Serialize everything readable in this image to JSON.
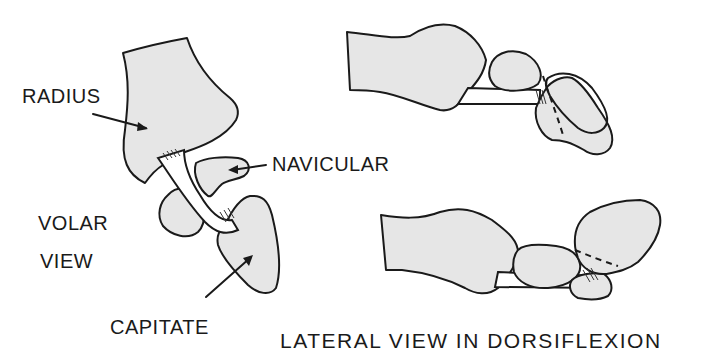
{
  "figure": {
    "panels": [
      {
        "id": "volar",
        "title_lines": [
          "VOLAR",
          "VIEW"
        ],
        "labels": {
          "radius": "RADIUS",
          "navicular": "NAVICULAR",
          "capitate": "CAPITATE"
        }
      },
      {
        "id": "lateral",
        "caption": "LATERAL VIEW IN DORSIFLEXION"
      }
    ],
    "colors": {
      "bone_fill": "#e6e6e6",
      "outline": "#1a1a1a",
      "background": "#ffffff"
    }
  }
}
